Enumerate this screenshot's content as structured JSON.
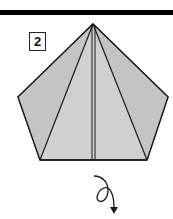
{
  "diagram": {
    "step_number": "2",
    "paper_color": "#cfcfcf",
    "line_color": "#1a1a1a",
    "bar_color": "#000000",
    "arrow": "turn-over-arrow"
  }
}
